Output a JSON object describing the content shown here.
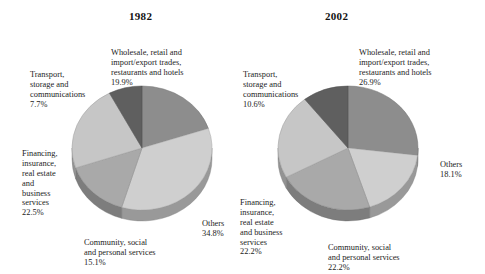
{
  "page": {
    "background": "#ffffff",
    "text_color": "#1c1c1c"
  },
  "chart_data": [
    {
      "type": "pie",
      "title": "1982",
      "three_d": true,
      "xlabel": "",
      "ylabel": "",
      "legend_position": "none",
      "grid": false,
      "categories": [
        "Wholesale, retail and import/export trades, restaurants and hotels",
        "Others",
        "Community, social and personal services",
        "Financing, insurance, real estate and business services",
        "Transport, storage and communications"
      ],
      "values": [
        19.9,
        34.8,
        15.1,
        22.5,
        7.7
      ],
      "colors": [
        "#8d8d8d",
        "#cfcfcf",
        "#a9a9a9",
        "#c6c6c6",
        "#5f5f5f"
      ],
      "labels": [
        {
          "name": "wholesale",
          "text": "Wholesale, retail and\nimport/export trades,\nrestaurants and hotels",
          "value": "19.9%"
        },
        {
          "name": "transport",
          "text": "Transport,\nstorage and\ncommunications",
          "value": "7.7%"
        },
        {
          "name": "financing",
          "text": "Financing,\ninsurance,\nreal estate\nand\nbusiness\nservices",
          "value": "22.5%"
        },
        {
          "name": "community",
          "text": "Community, social\nand personal services",
          "value": "15.1%"
        },
        {
          "name": "others",
          "text": "Others",
          "value": "34.8%"
        }
      ]
    },
    {
      "type": "pie",
      "title": "2002",
      "three_d": true,
      "xlabel": "",
      "ylabel": "",
      "legend_position": "none",
      "grid": false,
      "categories": [
        "Wholesale, retail and import/export trades, restaurants and hotels",
        "Others",
        "Community, social and personal services",
        "Financing, insurance, real estate and business services",
        "Transport, storage and communications"
      ],
      "values": [
        26.9,
        18.1,
        22.2,
        22.2,
        10.6
      ],
      "colors": [
        "#8d8d8d",
        "#cfcfcf",
        "#a9a9a9",
        "#c6c6c6",
        "#5f5f5f"
      ],
      "labels": [
        {
          "name": "wholesale",
          "text": "Wholesale, retail and\nimport/export trades,\nrestaurants and hotels",
          "value": "26.9%"
        },
        {
          "name": "transport",
          "text": "Transport,\nstorage and\ncommunications",
          "value": "10.6%"
        },
        {
          "name": "financing",
          "text": "Financing,\ninsurance,\nreal estate\nand business\nservices",
          "value": "22.2%"
        },
        {
          "name": "community",
          "text": "Community, social\nand personal services",
          "value": "22.2%"
        },
        {
          "name": "others",
          "text": "Others",
          "value": "18.1%"
        }
      ]
    }
  ]
}
